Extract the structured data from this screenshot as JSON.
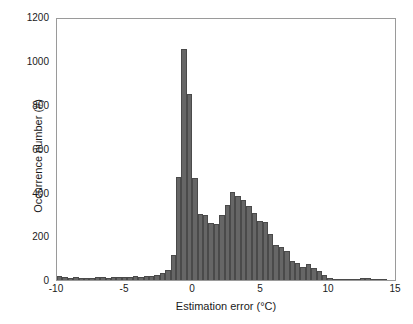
{
  "chart_data": {
    "type": "bar",
    "title": "",
    "subtitle": "",
    "xlabel": "Estimation error (°C)",
    "ylabel": "Occurrence number (#)",
    "xlim": [
      -10,
      15
    ],
    "ylim": [
      0,
      1200
    ],
    "xticks": [
      -10,
      -5,
      0,
      5,
      10,
      15
    ],
    "xtick_labels": [
      "-10",
      "-5",
      "0",
      "5",
      "10",
      "15"
    ],
    "yticks": [
      0,
      200,
      400,
      600,
      800,
      1000,
      1200
    ],
    "ytick_labels": [
      "0",
      "200",
      "400",
      "600",
      "800",
      "1000",
      "1200"
    ],
    "grid": false,
    "legend": null,
    "bar_color": "#666666",
    "bar_edge_color": "#4a4a4a",
    "bin_width": 0.4,
    "histogram_note": "Bimodal distribution: sharp primary peak near -0.6 °C, broad secondary mode near +2.6 °C",
    "categories": [
      -9.8,
      -9.4,
      -9.0,
      -8.6,
      -8.2,
      -7.8,
      -7.4,
      -7.0,
      -6.6,
      -6.2,
      -5.8,
      -5.4,
      -5.0,
      -4.6,
      -4.2,
      -3.8,
      -3.4,
      -3.0,
      -2.6,
      -2.2,
      -1.8,
      -1.4,
      -1.0,
      -0.6,
      -0.2,
      0.2,
      0.6,
      1.0,
      1.4,
      1.8,
      2.2,
      2.6,
      3.0,
      3.4,
      3.8,
      4.2,
      4.6,
      5.0,
      5.4,
      5.8,
      6.2,
      6.6,
      7.0,
      7.4,
      7.8,
      8.2,
      8.6,
      9.0,
      9.4,
      9.8,
      10.2,
      10.6,
      11.0,
      11.4,
      11.8,
      12.2,
      12.6,
      13.0,
      13.4,
      13.8,
      14.2,
      14.6
    ],
    "values": [
      18,
      12,
      10,
      12,
      9,
      11,
      10,
      13,
      12,
      10,
      16,
      12,
      14,
      16,
      17,
      16,
      18,
      20,
      22,
      34,
      44,
      116,
      474,
      1063,
      855,
      467,
      305,
      300,
      262,
      258,
      300,
      345,
      404,
      387,
      368,
      340,
      308,
      272,
      268,
      212,
      160,
      150,
      135,
      88,
      76,
      60,
      72,
      55,
      40,
      22,
      7,
      4,
      3,
      2,
      2,
      1,
      9,
      10,
      6,
      1,
      1,
      0
    ]
  }
}
